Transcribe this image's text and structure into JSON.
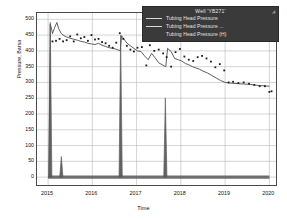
{
  "chart_data": {
    "type": "line",
    "title": "",
    "xlabel": "Time",
    "ylabel": "Pressure, Barsa",
    "xlim": [
      2014.75,
      2020.15
    ],
    "ylim": [
      -25,
      520
    ],
    "grid": true,
    "legend_position": "top-right",
    "xticks": [
      "2015",
      "2016",
      "2017",
      "2018",
      "2019",
      "2020"
    ],
    "xtick_values": [
      2015,
      2016,
      2017,
      2018,
      2019,
      2020
    ],
    "yticks": [
      "0",
      "50",
      "100",
      "150",
      "200",
      "250",
      "300",
      "350",
      "400",
      "450",
      "500"
    ],
    "ytick_values": [
      0,
      50,
      100,
      150,
      200,
      250,
      300,
      350,
      400,
      450,
      500
    ],
    "series": [
      {
        "name": "Tubing Head Pressure",
        "style": "line",
        "color": "#4d4d4d",
        "x": [
          2015.02,
          2015.05,
          2015.08,
          2015.1,
          2015.12,
          2015.14,
          2015.16,
          2015.2,
          2015.24,
          2015.3,
          2015.36,
          2015.42,
          2015.5,
          2015.58,
          2015.66,
          2015.74,
          2015.82,
          2015.9,
          2015.98,
          2016.06,
          2016.14,
          2016.22,
          2016.3,
          2016.38,
          2016.46,
          2016.52,
          2016.56,
          2016.6,
          2016.63,
          2016.66,
          2016.7,
          2016.78,
          2016.86,
          2016.94,
          2017.02,
          2017.1,
          2017.18,
          2017.26,
          2017.34,
          2017.42,
          2017.5,
          2017.58,
          2017.63,
          2017.66,
          2017.7,
          2017.78,
          2017.86,
          2017.94,
          2018.02,
          2018.1,
          2018.18,
          2018.26,
          2018.34,
          2018.42,
          2018.5,
          2018.6,
          2018.7,
          2018.8,
          2018.9,
          2019.0,
          2019.1,
          2019.2,
          2019.3,
          2019.42,
          2019.54,
          2019.66,
          2019.78,
          2019.9,
          2020.0
        ],
        "y": [
          0,
          485,
          470,
          455,
          462,
          470,
          478,
          490,
          470,
          455,
          448,
          444,
          440,
          437,
          434,
          430,
          428,
          424,
          422,
          420,
          424,
          418,
          414,
          410,
          408,
          406,
          404,
          402,
          400,
          448,
          440,
          425,
          416,
          408,
          400,
          398,
          384,
          372,
          392,
          378,
          362,
          356,
          352,
          350,
          408,
          398,
          376,
          372,
          368,
          360,
          356,
          350,
          346,
          342,
          336,
          330,
          322,
          314,
          306,
          300,
          298,
          297,
          296,
          295,
          294,
          292,
          290,
          289,
          288
        ]
      },
      {
        "name": "Tubing Head Pressure ...",
        "style": "scatter",
        "color": "#1a1a1a",
        "x": [
          2015.1,
          2015.18,
          2015.26,
          2015.34,
          2015.42,
          2015.5,
          2015.58,
          2015.66,
          2015.74,
          2015.82,
          2015.9,
          2015.98,
          2016.06,
          2016.14,
          2016.22,
          2016.3,
          2016.38,
          2016.46,
          2016.54,
          2016.62,
          2016.7,
          2016.78,
          2016.86,
          2016.94,
          2017.02,
          2017.12,
          2017.22,
          2017.3,
          2017.4,
          2017.5,
          2017.6,
          2017.68,
          2017.78,
          2017.88,
          2017.98,
          2018.08,
          2018.18,
          2018.28,
          2018.38,
          2018.48,
          2018.58,
          2018.68,
          2018.78,
          2018.88,
          2018.98,
          2019.08,
          2019.18,
          2019.3,
          2019.42,
          2019.54,
          2019.66,
          2019.78,
          2019.9,
          2020.0,
          2020.05
        ],
        "y": [
          430,
          432,
          438,
          430,
          434,
          446,
          430,
          452,
          440,
          444,
          432,
          450,
          436,
          438,
          428,
          424,
          416,
          410,
          426,
          456,
          438,
          416,
          404,
          398,
          410,
          412,
          354,
          418,
          400,
          404,
          392,
          380,
          350,
          396,
          406,
          382,
          372,
          368,
          380,
          384,
          376,
          366,
          348,
          358,
          338,
          300,
          302,
          298,
          300,
          296,
          292,
          288,
          288,
          270,
          272
        ]
      },
      {
        "name": "Tubing Head Pressure (H)",
        "style": "spikes",
        "color": "#5a5a5a",
        "baseline": 0,
        "spikes": [
          {
            "x": 2015.05,
            "y": 490
          },
          {
            "x": 2015.3,
            "y": 65
          },
          {
            "x": 2016.64,
            "y": 450
          },
          {
            "x": 2017.65,
            "y": 250
          }
        ],
        "x_range": [
          2015.0,
          2020.0
        ]
      }
    ]
  },
  "legend": {
    "title": "Well 'YB271'",
    "corner_icon": "resize-handle-icon",
    "entries": [
      {
        "label": "Tubing Head Pressure",
        "swatch": true
      },
      {
        "label": "Tubing Head Pressure ...",
        "swatch": true
      },
      {
        "label": "Tubing Head Pressure (H)",
        "swatch": false
      }
    ]
  }
}
